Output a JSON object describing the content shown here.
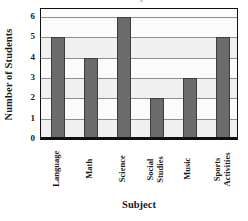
{
  "chart_data": {
    "type": "bar",
    "title": "",
    "xlabel": "Subject",
    "ylabel": "Number of Students",
    "categories": [
      "Language",
      "Math",
      "Science",
      "Social Studies",
      "Music",
      "Sports Activities"
    ],
    "values": [
      5,
      4,
      6,
      2,
      3,
      5
    ],
    "ylim": [
      0,
      6
    ],
    "ytick_labels": [
      "0",
      "1",
      "2",
      "3",
      "4",
      "5",
      "6"
    ],
    "ytick_values": [
      0,
      1,
      2,
      3,
      4,
      5,
      6
    ],
    "grid": true,
    "legend": false,
    "legend_position": "none",
    "orientation": "vertical",
    "bar_color": "#6b6b6b",
    "bar_edge_color": "#3d3d3d",
    "plot_background": "#fbfbfb",
    "gridline_color": "#8e8e8e",
    "axis_color": "#101010",
    "xtick_rotation": -90
  }
}
